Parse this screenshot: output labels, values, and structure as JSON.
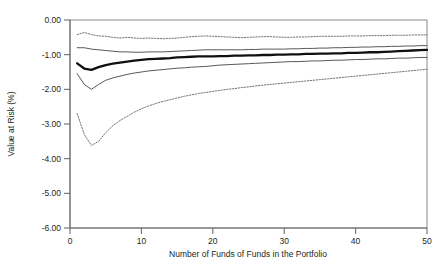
{
  "chart_data": {
    "type": "line",
    "title": "",
    "xlabel": "Number of Funds of Funds in the Portfolio",
    "ylabel": "Value at Risk (%)",
    "xlim": [
      0,
      50
    ],
    "ylim": [
      -6.0,
      0.0
    ],
    "xticks": [
      0,
      10,
      20,
      30,
      40,
      50
    ],
    "xticklabels": [
      "0",
      "10",
      "20",
      "30",
      "40",
      "50"
    ],
    "yticks": [
      0.0,
      -1.0,
      -2.0,
      -3.0,
      -4.0,
      -5.0,
      -6.0
    ],
    "yticklabels": [
      "0.00",
      "-1.00",
      "-2.00",
      "-3.00",
      "-4.00",
      "-5.00",
      "-6.00"
    ],
    "grid": false,
    "legend": "none",
    "x": [
      1,
      2,
      3,
      4,
      5,
      6,
      7,
      8,
      9,
      10,
      11,
      12,
      13,
      14,
      15,
      16,
      17,
      18,
      19,
      20,
      21,
      22,
      23,
      24,
      25,
      26,
      27,
      28,
      29,
      30,
      31,
      32,
      33,
      34,
      35,
      36,
      37,
      38,
      39,
      40,
      41,
      42,
      43,
      44,
      45,
      46,
      47,
      48,
      49,
      50
    ],
    "series": [
      {
        "name": "upper-outer-percentile",
        "style": "dotted",
        "values": [
          -0.42,
          -0.36,
          -0.42,
          -0.46,
          -0.47,
          -0.5,
          -0.52,
          -0.5,
          -0.52,
          -0.53,
          -0.52,
          -0.53,
          -0.54,
          -0.53,
          -0.52,
          -0.5,
          -0.48,
          -0.47,
          -0.46,
          -0.47,
          -0.48,
          -0.49,
          -0.5,
          -0.51,
          -0.5,
          -0.49,
          -0.48,
          -0.48,
          -0.49,
          -0.5,
          -0.5,
          -0.49,
          -0.49,
          -0.48,
          -0.47,
          -0.47,
          -0.47,
          -0.47,
          -0.46,
          -0.46,
          -0.46,
          -0.45,
          -0.45,
          -0.45,
          -0.44,
          -0.44,
          -0.44,
          -0.43,
          -0.43,
          -0.43
        ]
      },
      {
        "name": "upper-inner-percentile",
        "style": "solid-thin",
        "values": [
          -0.8,
          -0.8,
          -0.84,
          -0.86,
          -0.88,
          -0.9,
          -0.92,
          -0.92,
          -0.93,
          -0.93,
          -0.92,
          -0.92,
          -0.92,
          -0.91,
          -0.9,
          -0.89,
          -0.88,
          -0.87,
          -0.86,
          -0.86,
          -0.86,
          -0.86,
          -0.86,
          -0.86,
          -0.85,
          -0.85,
          -0.84,
          -0.84,
          -0.84,
          -0.84,
          -0.83,
          -0.83,
          -0.82,
          -0.82,
          -0.81,
          -0.81,
          -0.8,
          -0.8,
          -0.79,
          -0.79,
          -0.78,
          -0.78,
          -0.77,
          -0.77,
          -0.76,
          -0.76,
          -0.75,
          -0.75,
          -0.74,
          -0.74
        ]
      },
      {
        "name": "median",
        "style": "solid-thick",
        "values": [
          -1.25,
          -1.4,
          -1.44,
          -1.36,
          -1.3,
          -1.26,
          -1.23,
          -1.2,
          -1.17,
          -1.15,
          -1.13,
          -1.12,
          -1.11,
          -1.1,
          -1.08,
          -1.07,
          -1.06,
          -1.05,
          -1.05,
          -1.05,
          -1.04,
          -1.04,
          -1.03,
          -1.03,
          -1.02,
          -1.02,
          -1.01,
          -1.01,
          -1.0,
          -1.0,
          -0.99,
          -0.99,
          -0.98,
          -0.98,
          -0.97,
          -0.97,
          -0.96,
          -0.96,
          -0.95,
          -0.95,
          -0.94,
          -0.93,
          -0.93,
          -0.92,
          -0.91,
          -0.9,
          -0.89,
          -0.88,
          -0.87,
          -0.86
        ]
      },
      {
        "name": "lower-inner-percentile",
        "style": "solid-thin",
        "values": [
          -1.55,
          -1.86,
          -2.0,
          -1.86,
          -1.74,
          -1.67,
          -1.62,
          -1.57,
          -1.53,
          -1.5,
          -1.47,
          -1.45,
          -1.43,
          -1.41,
          -1.39,
          -1.38,
          -1.36,
          -1.35,
          -1.34,
          -1.32,
          -1.3,
          -1.29,
          -1.28,
          -1.27,
          -1.26,
          -1.25,
          -1.24,
          -1.23,
          -1.22,
          -1.21,
          -1.2,
          -1.2,
          -1.19,
          -1.18,
          -1.18,
          -1.17,
          -1.16,
          -1.16,
          -1.15,
          -1.14,
          -1.14,
          -1.13,
          -1.12,
          -1.12,
          -1.11,
          -1.1,
          -1.1,
          -1.09,
          -1.08,
          -1.08
        ]
      },
      {
        "name": "lower-outer-percentile",
        "style": "dotted",
        "values": [
          -2.7,
          -3.3,
          -3.62,
          -3.5,
          -3.25,
          -3.05,
          -2.9,
          -2.78,
          -2.66,
          -2.56,
          -2.48,
          -2.41,
          -2.35,
          -2.3,
          -2.25,
          -2.2,
          -2.16,
          -2.12,
          -2.09,
          -2.06,
          -2.03,
          -2.0,
          -1.98,
          -1.95,
          -1.93,
          -1.9,
          -1.88,
          -1.86,
          -1.84,
          -1.82,
          -1.8,
          -1.78,
          -1.76,
          -1.74,
          -1.72,
          -1.7,
          -1.68,
          -1.66,
          -1.64,
          -1.62,
          -1.6,
          -1.58,
          -1.56,
          -1.54,
          -1.52,
          -1.5,
          -1.48,
          -1.46,
          -1.44,
          -1.42
        ]
      }
    ],
    "colors": {
      "median": "#101010",
      "inner": "#3a3a3a",
      "outer": "#5a5a5a",
      "axis": "#6e6e6e",
      "text": "#231f20",
      "background": "#ffffff"
    }
  }
}
